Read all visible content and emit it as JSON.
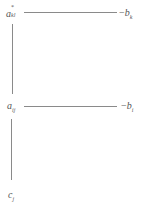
{
  "diagram": {
    "nodes": [
      {
        "id": "a_kl_star",
        "base": "a",
        "superscript": "*",
        "subscript": "kl"
      },
      {
        "id": "b_k",
        "prefix": "−",
        "base": "b",
        "subscript": "k"
      },
      {
        "id": "a_ij",
        "base": "a",
        "subscript": "ij"
      },
      {
        "id": "b_i",
        "prefix": "−",
        "base": "b",
        "subscript": "i"
      },
      {
        "id": "c_j",
        "base": "c",
        "subscript": "j"
      }
    ],
    "edges": [
      {
        "from": "a_kl_star",
        "to": "b_k"
      },
      {
        "from": "a_kl_star",
        "to": "a_ij"
      },
      {
        "from": "a_ij",
        "to": "b_i"
      },
      {
        "from": "a_ij",
        "to": "c_j"
      }
    ]
  }
}
